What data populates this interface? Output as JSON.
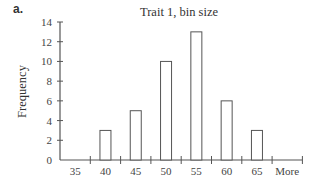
{
  "panel_label": "a.",
  "chart_data": {
    "type": "bar",
    "title": "Trait 1, bin size",
    "xlabel": "",
    "ylabel": "Frequency",
    "categories": [
      "35",
      "40",
      "45",
      "50",
      "55",
      "60",
      "65",
      "More"
    ],
    "values": [
      0,
      3,
      5,
      10,
      13,
      6,
      3,
      0
    ],
    "yticks": [
      0,
      2,
      4,
      6,
      8,
      10,
      12,
      14
    ],
    "ylim": [
      0,
      14
    ],
    "grid": false,
    "legend": null
  }
}
